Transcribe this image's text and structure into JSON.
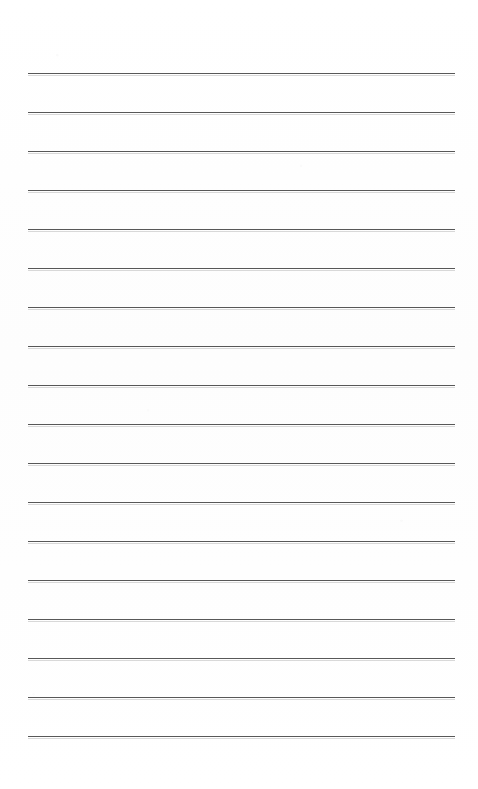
{
  "document": {
    "title": "Lined Paper Sheet",
    "description": "Blank ruled notebook paper scan",
    "page_width": 478,
    "page_height": 789,
    "background_color": "#fefefe",
    "has_visible_text": false,
    "body_text": ""
  },
  "ruling": {
    "line_color": "#4a4a4a",
    "line_thickness_px": 1.4,
    "line_count": 18,
    "left_margin_px": 28,
    "right_margin_px": 455,
    "first_line_y_px": 73,
    "line_spacing_px": 39,
    "lines_y": [
      73,
      112,
      151,
      190,
      229,
      268,
      307,
      346,
      385,
      424,
      463,
      502,
      541,
      580,
      619,
      658,
      697,
      736
    ]
  }
}
